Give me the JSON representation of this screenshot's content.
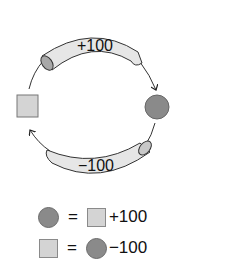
{
  "diagram": {
    "top_tube_label": "+100",
    "bottom_tube_label": "−100",
    "left_node": "square",
    "right_node": "circle",
    "top_arrow": "square-to-circle",
    "bottom_arrow": "circle-to-square"
  },
  "legend": {
    "row1": {
      "lhs": "circle",
      "equals": "=",
      "rhs_shape": "square",
      "rhs_value": "+100"
    },
    "row2": {
      "lhs": "square",
      "equals": "=",
      "rhs_shape": "circle",
      "rhs_value": "−100"
    }
  },
  "colors": {
    "circle_fill": "#8a8a8a",
    "square_fill": "#d4d4d4",
    "tube_fill": "#e6e6e6",
    "stroke": "#333333"
  }
}
